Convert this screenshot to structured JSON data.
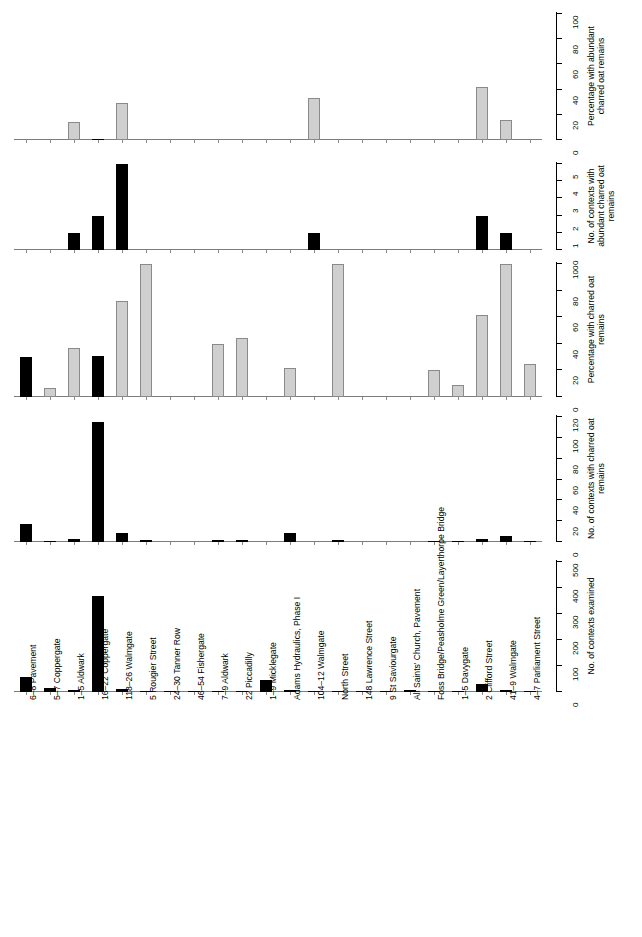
{
  "figure": {
    "categories": [
      "6–8 Pavement",
      "5–7 Coppergate",
      "1–5 Aldwark",
      "16–22 Coppergate",
      "118–26 Walmgate",
      "5 Rougier Street",
      "24–30 Tanner Row",
      "46–54 Fishergate",
      "7–9 Aldwark",
      "22 Piccadilly",
      "1–9 Micklegate",
      "Adams Hydraulics, Phase I",
      "104–12 Walmgate",
      "North Street",
      "148 Lawrence Street",
      "9 St Saviourgate",
      "All Saints' Church, Pavement",
      "Foss Bridge/Peasholme Green/Layerthorpe Bridge",
      "1–5 Davygate",
      "2 Clifford Street",
      "41–9 Walmgate",
      "4–7 Parliament Street"
    ],
    "colors": {
      "bar_gray": "#cfcfcf",
      "bar_gray_edge": "#8a8a8a",
      "bar_black": "#000000",
      "axis": "#000000",
      "baseline": "#7c7c7c"
    }
  },
  "chart_data": [
    {
      "type": "bar",
      "panel_index": 1,
      "title": "",
      "ylabel": "Percentage with abundant charred oat remains",
      "xlabel": "",
      "ylim": [
        0,
        100
      ],
      "yticks": [
        0,
        20,
        40,
        60,
        80,
        100
      ],
      "ytick_labels": [
        "0",
        "20",
        "40",
        "60",
        "80",
        "100"
      ],
      "grid": false,
      "legend": "none",
      "categories": [
        "6–8 Pavement",
        "5–7 Coppergate",
        "1–5 Aldwark",
        "16–22 Coppergate",
        "118–26 Walmgate",
        "5 Rougier Street",
        "24–30 Tanner Row",
        "46–54 Fishergate",
        "7–9 Aldwark",
        "22 Piccadilly",
        "1–9 Micklegate",
        "Adams Hydraulics, Phase I",
        "104–12 Walmgate",
        "North Street",
        "148 Lawrence Street",
        "9 St Saviourgate",
        "All Saints' Church, Pavement",
        "Foss Bridge/Peasholme Green/Layerthorpe Bridge",
        "1–5 Davygate",
        "2 Clifford Street",
        "41–9 Walmgate",
        "4–7 Parliament Street"
      ],
      "values": [
        0,
        0,
        14,
        1,
        29,
        0,
        0,
        0,
        0,
        0,
        0,
        0,
        33,
        0,
        0,
        0,
        0,
        0,
        0,
        42,
        16,
        0
      ],
      "bar_fills": [
        "gray",
        "gray",
        "gray",
        "black",
        "gray",
        "gray",
        "gray",
        "gray",
        "gray",
        "gray",
        "gray",
        "gray",
        "gray",
        "gray",
        "gray",
        "gray",
        "gray",
        "gray",
        "gray",
        "gray",
        "gray",
        "gray"
      ]
    },
    {
      "type": "bar",
      "panel_index": 2,
      "title": "",
      "ylabel": "No. of contexts with abundant charred oat remains",
      "xlabel": "",
      "ylim": [
        0,
        5
      ],
      "yticks": [
        0,
        1,
        2,
        3,
        4,
        5
      ],
      "ytick_labels": [
        "0",
        "1",
        "2",
        "3",
        "4",
        "5"
      ],
      "grid": false,
      "legend": "none",
      "categories": [
        "6–8 Pavement",
        "5–7 Coppergate",
        "1–5 Aldwark",
        "16–22 Coppergate",
        "118–26 Walmgate",
        "5 Rougier Street",
        "24–30 Tanner Row",
        "46–54 Fishergate",
        "7–9 Aldwark",
        "22 Piccadilly",
        "1–9 Micklegate",
        "Adams Hydraulics, Phase I",
        "104–12 Walmgate",
        "North Street",
        "148 Lawrence Street",
        "9 St Saviourgate",
        "All Saints' Church, Pavement",
        "Foss Bridge/Peasholme Green/Layerthorpe Bridge",
        "1–5 Davygate",
        "2 Clifford Street",
        "41–9 Walmgate",
        "4–7 Parliament Street"
      ],
      "values": [
        0,
        0,
        1,
        2,
        5,
        0,
        0,
        0,
        0,
        0,
        0,
        0,
        1,
        0,
        0,
        0,
        0,
        0,
        0,
        2,
        1,
        0
      ],
      "bar_fills": [
        "black",
        "black",
        "black",
        "black",
        "black",
        "black",
        "black",
        "black",
        "black",
        "black",
        "black",
        "black",
        "black",
        "black",
        "black",
        "black",
        "black",
        "black",
        "black",
        "black",
        "black",
        "black"
      ]
    },
    {
      "type": "bar",
      "panel_index": 3,
      "title": "",
      "ylabel": "Percentage with charred oat remains",
      "xlabel": "",
      "ylim": [
        0,
        100
      ],
      "yticks": [
        0,
        20,
        40,
        60,
        80,
        100
      ],
      "ytick_labels": [
        "0",
        "20",
        "40",
        "60",
        "80",
        "100"
      ],
      "grid": false,
      "legend": "none",
      "categories": [
        "6–8 Pavement",
        "5–7 Coppergate",
        "1–5 Aldwark",
        "16–22 Coppergate",
        "118–26 Walmgate",
        "5 Rougier Street",
        "24–30 Tanner Row",
        "46–54 Fishergate",
        "7–9 Aldwark",
        "22 Piccadilly",
        "1–9 Micklegate",
        "Adams Hydraulics, Phase I",
        "104–12 Walmgate",
        "North Street",
        "148 Lawrence Street",
        "9 St Saviourgate",
        "All Saints' Church, Pavement",
        "Foss Bridge/Peasholme Green/Layerthorpe Bridge",
        "1–5 Davygate",
        "2 Clifford Street",
        "41–9 Walmgate",
        "4–7 Parliament Street"
      ],
      "values": [
        30,
        7,
        37,
        31,
        72,
        100,
        0,
        0,
        40,
        44,
        0,
        22,
        0,
        100,
        0,
        0,
        0,
        20,
        9,
        62,
        100,
        25
      ],
      "bar_fills": [
        "black",
        "gray",
        "gray",
        "black",
        "gray",
        "gray",
        "gray",
        "gray",
        "gray",
        "gray",
        "gray",
        "gray",
        "gray",
        "gray",
        "gray",
        "gray",
        "gray",
        "gray",
        "gray",
        "gray",
        "gray",
        "gray"
      ]
    },
    {
      "type": "bar",
      "panel_index": 4,
      "title": "",
      "ylabel": "No. of contexts with charred oat remains",
      "xlabel": "",
      "ylim": [
        0,
        120
      ],
      "yticks": [
        0,
        20,
        40,
        60,
        80,
        100,
        120
      ],
      "ytick_labels": [
        "0",
        "20",
        "40",
        "60",
        "80",
        "100",
        "120"
      ],
      "grid": false,
      "legend": "none",
      "categories": [
        "6–8 Pavement",
        "5–7 Coppergate",
        "1–5 Aldwark",
        "16–22 Coppergate",
        "118–26 Walmgate",
        "5 Rougier Street",
        "24–30 Tanner Row",
        "46–54 Fishergate",
        "7–9 Aldwark",
        "22 Piccadilly",
        "1–9 Micklegate",
        "Adams Hydraulics, Phase I",
        "104–12 Walmgate",
        "North Street",
        "148 Lawrence Street",
        "9 St Saviourgate",
        "All Saints' Church, Pavement",
        "Foss Bridge/Peasholme Green/Layerthorpe Bridge",
        "1–5 Davygate",
        "2 Clifford Street",
        "41–9 Walmgate",
        "4–7 Parliament Street"
      ],
      "values": [
        17,
        1,
        3,
        115,
        9,
        2,
        0,
        0,
        2,
        2,
        0,
        9,
        0,
        2,
        0,
        0,
        0,
        1,
        1,
        3,
        6,
        1
      ],
      "bar_fills": [
        "black",
        "black",
        "black",
        "black",
        "black",
        "black",
        "black",
        "black",
        "black",
        "black",
        "black",
        "black",
        "black",
        "black",
        "black",
        "black",
        "black",
        "black",
        "black",
        "black",
        "black",
        "black"
      ]
    },
    {
      "type": "bar",
      "panel_index": 5,
      "title": "",
      "ylabel": "No. of contexts examined",
      "xlabel": "",
      "ylim": [
        0,
        500
      ],
      "yticks": [
        0,
        100,
        200,
        300,
        400,
        500
      ],
      "ytick_labels": [
        "0",
        "100",
        "200",
        "300",
        "400",
        "500"
      ],
      "grid": false,
      "legend": "none",
      "categories": [
        "6–8 Pavement",
        "5–7 Coppergate",
        "1–5 Aldwark",
        "16–22 Coppergate",
        "118–26 Walmgate",
        "5 Rougier Street",
        "24–30 Tanner Row",
        "46–54 Fishergate",
        "7–9 Aldwark",
        "22 Piccadilly",
        "1–9 Micklegate",
        "Adams Hydraulics, Phase I",
        "104–12 Walmgate",
        "North Street",
        "148 Lawrence Street",
        "9 St Saviourgate",
        "All Saints' Church, Pavement",
        "Foss Bridge/Peasholme Green/Layerthorpe Bridge",
        "1–5 Davygate",
        "2 Clifford Street",
        "41–9 Walmgate",
        "4–7 Parliament Street"
      ],
      "values": [
        56,
        14,
        8,
        371,
        13,
        2,
        2,
        2,
        5,
        5,
        46,
        9,
        3,
        2,
        5,
        5,
        6,
        5,
        2,
        30,
        6,
        4
      ],
      "bar_fills": [
        "black",
        "black",
        "black",
        "black",
        "black",
        "black",
        "black",
        "black",
        "black",
        "black",
        "black",
        "black",
        "black",
        "black",
        "black",
        "black",
        "black",
        "black",
        "black",
        "black",
        "black",
        "black"
      ]
    }
  ]
}
